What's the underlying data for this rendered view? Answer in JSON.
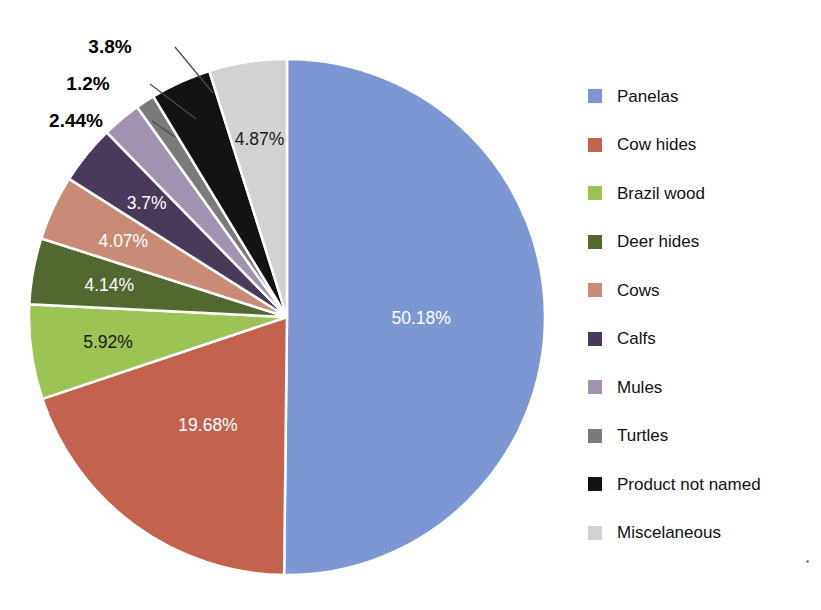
{
  "chart_data": {
    "type": "pie",
    "title": "",
    "subtitle": "",
    "xlabel": "",
    "ylabel": "",
    "legend_position": "right",
    "grid": false,
    "start_angle_deg": 0,
    "direction": "clockwise",
    "value_unit": "percent",
    "categories": [
      "Panelas",
      "Cow hides",
      "Brazil wood",
      "Deer hides",
      "Cows",
      "Calfs",
      "Mules",
      "Turtles",
      "Product not named",
      "Miscelaneous"
    ],
    "values": [
      50.18,
      19.68,
      5.92,
      4.14,
      4.07,
      3.7,
      2.44,
      1.2,
      3.8,
      4.87
    ],
    "labels": [
      "50.18%",
      "19.68%",
      "5.92%",
      "4.14%",
      "4.07%",
      "3.7%",
      "2.44%",
      "1.2%",
      "3.8%",
      "4.87%"
    ],
    "colors": [
      "#7d96d4",
      "#c3634d",
      "#9dc355",
      "#53682f",
      "#c98b76",
      "#4a3a5a",
      "#a193b0",
      "#7a7a7a",
      "#121212",
      "#d2d2d2"
    ],
    "slices": [
      {
        "name": "Panelas",
        "value": 50.18,
        "label": "50.18%",
        "color": "#7d96d4",
        "label_placement": "inside",
        "label_color": "#ffffff"
      },
      {
        "name": "Cow hides",
        "value": 19.68,
        "label": "19.68%",
        "color": "#c3634d",
        "label_placement": "inside",
        "label_color": "#ffffff"
      },
      {
        "name": "Brazil wood",
        "value": 5.92,
        "label": "5.92%",
        "color": "#9dc355",
        "label_placement": "inside",
        "label_color": "#1a1a1a"
      },
      {
        "name": "Deer hides",
        "value": 4.14,
        "label": "4.14%",
        "color": "#53682f",
        "label_placement": "inside",
        "label_color": "#ffffff"
      },
      {
        "name": "Cows",
        "value": 4.07,
        "label": "4.07%",
        "color": "#c98b76",
        "label_placement": "inside",
        "label_color": "#ffffff"
      },
      {
        "name": "Calfs",
        "value": 3.7,
        "label": "3.7%",
        "color": "#4a3a5a",
        "label_placement": "inside",
        "label_color": "#ffffff"
      },
      {
        "name": "Mules",
        "value": 2.44,
        "label": "2.44%",
        "color": "#a193b0",
        "label_placement": "outside",
        "label_color": "#000000"
      },
      {
        "name": "Turtles",
        "value": 1.2,
        "label": "1.2%",
        "color": "#7a7a7a",
        "label_placement": "outside",
        "label_color": "#000000"
      },
      {
        "name": "Product not named",
        "value": 3.8,
        "label": "3.8%",
        "color": "#121212",
        "label_placement": "outside",
        "label_color": "#000000"
      },
      {
        "name": "Miscelaneous",
        "value": 4.87,
        "label": "4.87%",
        "color": "#d2d2d2",
        "label_placement": "inside",
        "label_color": "#1a1a1a"
      }
    ]
  },
  "legend": {
    "items": [
      {
        "label": "Panelas",
        "color": "#7d96d4"
      },
      {
        "label": "Cow hides",
        "color": "#c3634d"
      },
      {
        "label": "Brazil wood",
        "color": "#9dc355"
      },
      {
        "label": "Deer hides",
        "color": "#53682f"
      },
      {
        "label": "Cows",
        "color": "#c98b76"
      },
      {
        "label": "Calfs",
        "color": "#4a3a5a"
      },
      {
        "label": "Mules",
        "color": "#a193b0"
      },
      {
        "label": "Turtles",
        "color": "#7a7a7a"
      },
      {
        "label": "Product not named",
        "color": "#121212"
      },
      {
        "label": "Miscelaneous",
        "color": "#d2d2d2"
      }
    ]
  }
}
